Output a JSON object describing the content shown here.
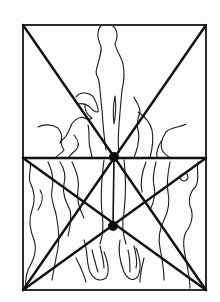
{
  "diagram": {
    "type": "compositional-geometry-overlay",
    "colors": {
      "line": "#111111",
      "background": "#fdfdfd",
      "figure_stroke": "#1a1a1a"
    },
    "frame": {
      "x1": 23,
      "y1": 25,
      "x2": 206,
      "y2": 290
    },
    "horizontal_line_y": 158,
    "nodes": [
      {
        "name": "upper-intersection",
        "x": 114,
        "y": 157,
        "r": 5
      },
      {
        "name": "lower-intersection",
        "x": 113,
        "y": 226,
        "r": 5
      }
    ],
    "construction_lines": [
      {
        "name": "diagonal-tl-br",
        "from": [
          23,
          25
        ],
        "to": [
          206,
          290
        ]
      },
      {
        "name": "diagonal-tr-bl",
        "from": [
          206,
          25
        ],
        "to": [
          23,
          290
        ]
      },
      {
        "name": "midline-horizontal",
        "from": [
          23,
          158
        ],
        "to": [
          206,
          158
        ]
      },
      {
        "name": "bl-to-right-mid",
        "from": [
          23,
          290
        ],
        "to": [
          206,
          158
        ]
      },
      {
        "name": "br-to-left-mid",
        "from": [
          206,
          290
        ],
        "to": [
          23,
          158
        ]
      },
      {
        "name": "vertical-center",
        "from": [
          114,
          157
        ],
        "to": [
          113,
          226
        ]
      }
    ]
  }
}
